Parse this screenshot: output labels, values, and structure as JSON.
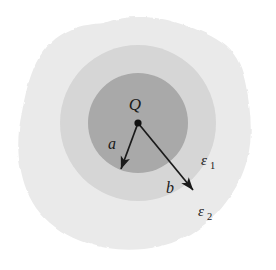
{
  "figure": {
    "kind": "physics-diagram",
    "background_color": "#ffffff"
  },
  "regions": {
    "inner_sphere": {
      "name": "inner-sphere",
      "fill": "#a9a9a9",
      "center_x": 138,
      "center_y": 123,
      "radius": 50
    },
    "dielectric_shell": {
      "name": "dielectric-shell-epsilon-1",
      "fill": "#d6d6d6",
      "center_x": 138,
      "center_y": 123,
      "radius": 78
    },
    "outer_medium": {
      "name": "outer-medium-epsilon-2",
      "fill": "#eaeaea"
    }
  },
  "labels": {
    "charge": {
      "text": "Q",
      "x": 135,
      "y": 110
    },
    "radius_a": {
      "text": "a",
      "x": 112,
      "y": 149
    },
    "radius_b": {
      "text": "b",
      "x": 170,
      "y": 193
    },
    "permittivity_1": {
      "symbol": "ε",
      "subscript": "1",
      "x": 201,
      "y": 165
    },
    "permittivity_2": {
      "symbol": "ε",
      "subscript": "2",
      "x": 198,
      "y": 216
    }
  },
  "vectors": {
    "a": {
      "name": "radius-vector-a",
      "from_x": 138,
      "from_y": 123,
      "to_x": 121,
      "to_y": 169,
      "stroke": "#1a1a1a"
    },
    "b": {
      "name": "radius-vector-b",
      "from_x": 138,
      "from_y": 123,
      "to_x": 193,
      "to_y": 190,
      "stroke": "#1a1a1a"
    }
  },
  "charge_point": {
    "name": "point-charge-dot",
    "x": 138,
    "y": 123,
    "radius": 3.6,
    "fill": "#111111"
  }
}
